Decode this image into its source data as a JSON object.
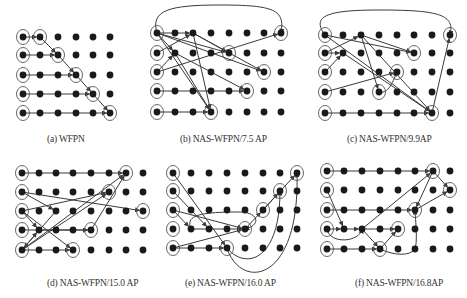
{
  "figure": {
    "colors": {
      "node": "#1a1a1a",
      "edge": "#3a3a3a",
      "ring": "#555555",
      "caption": "#333333"
    },
    "panels": [
      {
        "id": "a",
        "caption": "(a) WFPN",
        "caption_pos": [
          47,
          142
        ],
        "cols": 6,
        "rows": 5,
        "xs": [
          23,
          40,
          58,
          76,
          93,
          110
        ],
        "ys": [
          37,
          55,
          75,
          94,
          113
        ],
        "rings": [
          [
            0,
            0
          ],
          [
            1,
            0
          ],
          [
            0,
            1
          ],
          [
            2,
            1
          ],
          [
            0,
            2
          ],
          [
            3,
            2
          ],
          [
            0,
            3
          ],
          [
            4,
            3
          ],
          [
            0,
            4
          ],
          [
            5,
            4
          ]
        ],
        "edges": [
          {
            "from": [
              0,
              0
            ],
            "to": [
              1,
              0
            ]
          },
          {
            "from": [
              1,
              0
            ],
            "to": [
              2,
              1
            ]
          },
          {
            "from": [
              0,
              1
            ],
            "to": [
              2,
              1
            ]
          },
          {
            "from": [
              2,
              1
            ],
            "to": [
              3,
              2
            ]
          },
          {
            "from": [
              0,
              2
            ],
            "to": [
              3,
              2
            ]
          },
          {
            "from": [
              3,
              2
            ],
            "to": [
              4,
              3
            ]
          },
          {
            "from": [
              0,
              3
            ],
            "to": [
              4,
              3
            ]
          },
          {
            "from": [
              4,
              3
            ],
            "to": [
              5,
              4
            ]
          },
          {
            "from": [
              0,
              4
            ],
            "to": [
              5,
              4
            ]
          }
        ]
      },
      {
        "id": "b",
        "caption": "(b) NAS-WFPN/7.5 AP",
        "caption_pos": [
          180,
          142
        ],
        "cols": 8,
        "rows": 5,
        "xs": [
          157,
          175,
          193,
          211,
          229,
          247,
          264,
          281
        ],
        "ys": [
          33,
          53,
          72,
          91,
          112
        ],
        "rings": [
          [
            0,
            0
          ],
          [
            7,
            0
          ],
          [
            0,
            1
          ],
          [
            4,
            1
          ],
          [
            0,
            2
          ],
          [
            6,
            2
          ],
          [
            0,
            3
          ],
          [
            5,
            3
          ],
          [
            0,
            4
          ],
          [
            3,
            4
          ]
        ],
        "edges": [
          {
            "from": [
              0,
              0
            ],
            "to": [
              2,
              0
            ]
          },
          {
            "from": [
              0,
              1
            ],
            "to": [
              2,
              0
            ]
          },
          {
            "from": [
              0,
              0
            ],
            "to": [
              1,
              1
            ]
          },
          {
            "from": [
              0,
              2
            ],
            "to": [
              1,
              1
            ]
          },
          {
            "from": [
              2,
              0
            ],
            "to": [
              4,
              1
            ]
          },
          {
            "from": [
              0,
              0
            ],
            "to": [
              4,
              1
            ]
          },
          {
            "from": [
              0,
              2
            ],
            "to": [
              7,
              0
            ]
          },
          {
            "from": [
              2,
              0
            ],
            "to": [
              6,
              2
            ]
          },
          {
            "from": [
              0,
              0
            ],
            "to": [
              6,
              2
            ]
          },
          {
            "from": [
              1,
              1
            ],
            "to": [
              5,
              3
            ]
          },
          {
            "from": [
              0,
              3
            ],
            "to": [
              5,
              3
            ]
          },
          {
            "from": [
              0,
              0
            ],
            "to": [
              3,
              4
            ]
          },
          {
            "from": [
              1,
              1
            ],
            "to": [
              3,
              4
            ]
          },
          {
            "from": [
              2,
              0
            ],
            "to": [
              3,
              4
            ]
          },
          {
            "from": [
              0,
              4
            ],
            "to": [
              3,
              4
            ]
          }
        ],
        "curves": [
          {
            "d": "M157,33 C150,10 170,5 220,5 C275,5 285,10 281,33"
          }
        ]
      },
      {
        "id": "c",
        "caption": "(c) NAS-WFPN/9.9AP",
        "caption_pos": [
          347,
          142
        ],
        "cols": 8,
        "rows": 5,
        "xs": [
          325,
          343,
          361,
          379,
          397,
          414,
          432,
          450
        ],
        "ys": [
          35,
          53,
          72,
          92,
          113
        ],
        "rings": [
          [
            0,
            0
          ],
          [
            7,
            0
          ],
          [
            0,
            1
          ],
          [
            5,
            1
          ],
          [
            0,
            2
          ],
          [
            4,
            2
          ],
          [
            0,
            3
          ],
          [
            3,
            3
          ],
          [
            0,
            4
          ],
          [
            6,
            4
          ]
        ],
        "edges": [
          {
            "from": [
              0,
              0
            ],
            "to": [
              5,
              1
            ]
          },
          {
            "from": [
              0,
              1
            ],
            "to": [
              2,
              0
            ]
          },
          {
            "from": [
              2,
              0
            ],
            "to": [
              5,
              1
            ]
          },
          {
            "from": [
              0,
              2
            ],
            "to": [
              1,
              1
            ]
          },
          {
            "from": [
              0,
              1
            ],
            "to": [
              1,
              1
            ]
          },
          {
            "from": [
              1,
              1
            ],
            "to": [
              6,
              4
            ]
          },
          {
            "from": [
              0,
              0
            ],
            "to": [
              6,
              4
            ]
          },
          {
            "from": [
              2,
              0
            ],
            "to": [
              3,
              3
            ]
          },
          {
            "from": [
              0,
              3
            ],
            "to": [
              4,
              2
            ]
          },
          {
            "from": [
              0,
              4
            ],
            "to": [
              6,
              4
            ]
          },
          {
            "from": [
              6,
              4
            ],
            "to": [
              7,
              0
            ]
          },
          {
            "from": [
              2,
              0
            ],
            "to": [
              6,
              4
            ]
          }
        ],
        "curves": [
          {
            "d": "M325,35 C310,15 330,10 380,10 C440,10 455,15 450,35"
          },
          {
            "d": "M379,92 C390,95 395,75 397,72"
          }
        ]
      },
      {
        "id": "d",
        "caption": "(d) NAS-WFPN/15.0 AP",
        "caption_pos": [
          47,
          286
        ],
        "cols": 8,
        "rows": 5,
        "xs": [
          22,
          39,
          56,
          73,
          91,
          109,
          126,
          143
        ],
        "ys": [
          173,
          192,
          211,
          230,
          250
        ],
        "rings": [
          [
            0,
            0
          ],
          [
            6,
            0
          ],
          [
            0,
            1
          ],
          [
            5,
            1
          ],
          [
            0,
            2
          ],
          [
            7,
            2
          ],
          [
            0,
            3
          ],
          [
            4,
            3
          ],
          [
            0,
            4
          ],
          [
            3,
            4
          ]
        ],
        "edges": [
          {
            "from": [
              0,
              0
            ],
            "to": [
              6,
              0
            ]
          },
          {
            "from": [
              0,
              2
            ],
            "to": [
              5,
              1
            ]
          },
          {
            "from": [
              0,
              1
            ],
            "to": [
              7,
              2
            ]
          },
          {
            "from": [
              0,
              1
            ],
            "to": [
              2,
              2
            ]
          },
          {
            "from": [
              0,
              2
            ],
            "to": [
              1,
              3
            ]
          },
          {
            "from": [
              0,
              4
            ],
            "to": [
              1,
              3
            ]
          },
          {
            "from": [
              1,
              3
            ],
            "to": [
              4,
              3
            ]
          },
          {
            "from": [
              0,
              4
            ],
            "to": [
              6,
              0
            ]
          },
          {
            "from": [
              0,
              4
            ],
            "to": [
              5,
              1
            ]
          },
          {
            "from": [
              4,
              3
            ],
            "to": [
              6,
              0
            ]
          },
          {
            "from": [
              0,
              2
            ],
            "to": [
              3,
              4
            ]
          },
          {
            "from": [
              2,
              2
            ],
            "to": [
              0,
              4
            ]
          },
          {
            "from": [
              0,
              4
            ],
            "to": [
              3,
              4
            ]
          },
          {
            "from": [
              0,
              3
            ],
            "to": [
              4,
              3
            ]
          }
        ]
      },
      {
        "id": "e",
        "caption": "(e) NAS-WFPN/16.0 AP",
        "caption_pos": [
          185,
          286
        ],
        "cols": 8,
        "rows": 5,
        "xs": [
          173,
          191,
          209,
          227,
          245,
          263,
          280,
          297
        ],
        "ys": [
          173,
          191,
          210,
          229,
          248
        ],
        "rings": [
          [
            0,
            0
          ],
          [
            7,
            0
          ],
          [
            0,
            1
          ],
          [
            6,
            1
          ],
          [
            0,
            2
          ],
          [
            5,
            2
          ],
          [
            0,
            3
          ],
          [
            4,
            3
          ],
          [
            0,
            4
          ],
          [
            3,
            4
          ]
        ],
        "edges": [
          {
            "from": [
              0,
              1
            ],
            "to": [
              2,
              3
            ]
          },
          {
            "from": [
              0,
              2
            ],
            "to": [
              1,
              3
            ]
          },
          {
            "from": [
              0,
              2
            ],
            "to": [
              4,
              3
            ]
          },
          {
            "from": [
              1,
              3
            ],
            "to": [
              4,
              3
            ]
          },
          {
            "from": [
              0,
              4
            ],
            "to": [
              4,
              3
            ]
          },
          {
            "from": [
              0,
              0
            ],
            "to": [
              3,
              4
            ]
          },
          {
            "from": [
              0,
              4
            ],
            "to": [
              3,
              4
            ]
          },
          {
            "from": [
              4,
              3
            ],
            "to": [
              5,
              2
            ]
          },
          {
            "from": [
              5,
              2
            ],
            "to": [
              7,
              0
            ]
          },
          {
            "from": [
              5,
              2
            ],
            "to": [
              6,
              1
            ]
          }
        ],
        "curves": [
          {
            "d": "M191,229 C185,215 200,212 240,212 C258,212 262,225 245,229"
          },
          {
            "d": "M227,248 C245,270 280,262 280,191"
          },
          {
            "d": "M227,248 C240,290 300,285 297,173"
          }
        ]
      },
      {
        "id": "f",
        "caption": "(f) NAS-WFPN/16.8AP",
        "caption_pos": [
          355,
          286
        ],
        "cols": 8,
        "rows": 5,
        "xs": [
          327,
          344,
          362,
          380,
          398,
          415,
          433,
          450
        ],
        "ys": [
          171,
          190,
          210,
          229,
          249
        ],
        "rings": [
          [
            0,
            0
          ],
          [
            6,
            0
          ],
          [
            0,
            1
          ],
          [
            7,
            1
          ],
          [
            0,
            2
          ],
          [
            5,
            2
          ],
          [
            0,
            3
          ],
          [
            4,
            3
          ],
          [
            0,
            4
          ],
          [
            3,
            4
          ]
        ],
        "edges": [
          {
            "from": [
              0,
              0
            ],
            "to": [
              6,
              0
            ]
          },
          {
            "from": [
              0,
              1
            ],
            "to": [
              1,
              3
            ]
          },
          {
            "from": [
              0,
              3
            ],
            "to": [
              1,
              3
            ]
          },
          {
            "from": [
              1,
              3
            ],
            "to": [
              2,
              3
            ]
          },
          {
            "from": [
              2,
              3
            ],
            "to": [
              4,
              3
            ]
          },
          {
            "from": [
              2,
              3
            ],
            "to": [
              6,
              0
            ]
          },
          {
            "from": [
              0,
              2
            ],
            "to": [
              5,
              2
            ]
          },
          {
            "from": [
              6,
              0
            ],
            "to": [
              5,
              2
            ]
          },
          {
            "from": [
              6,
              0
            ],
            "to": [
              7,
              1
            ]
          },
          {
            "from": [
              5,
              2
            ],
            "to": [
              7,
              1
            ]
          },
          {
            "from": [
              0,
              4
            ],
            "to": [
              3,
              4
            ]
          },
          {
            "from": [
              2,
              3
            ],
            "to": [
              3,
              4
            ]
          },
          {
            "from": [
              3,
              4
            ],
            "to": [
              4,
              3
            ]
          }
        ],
        "curves": [
          {
            "d": "M327,229 C330,245 360,242 362,229"
          },
          {
            "d": "M380,249 C395,256 410,256 415,249 C418,240 415,215 415,210"
          }
        ]
      }
    ]
  }
}
